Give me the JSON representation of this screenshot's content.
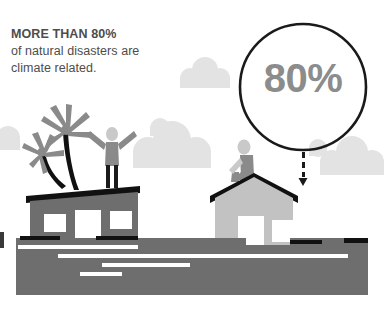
{
  "canvas": {
    "width": 384,
    "height": 318,
    "background": "#ffffff"
  },
  "headline": {
    "line1": "MORE THAN 80%",
    "line2": "of natural disasters are",
    "line3": "climate related.",
    "color": "#4d4d4d"
  },
  "stat_circle": {
    "value_label": "80%",
    "ring_color": "#1a1a1a",
    "value_color": "#8c8c8c",
    "center_x": 303,
    "center_y": 87,
    "radius": 63
  },
  "arrow": {
    "direction": "down",
    "color": "#1a1a1a",
    "dash_count": 3
  },
  "palette": {
    "house_left_wall": "#6e6e6e",
    "house_left_roof": "#111111",
    "house_right_wall": "#c2c2c2",
    "house_right_roof": "#111111",
    "window_fill": "#ffffff",
    "water": "#6e6e6e",
    "water_wave": "#ffffff",
    "cloud": "#e3e3e3",
    "palm_frond": "#8a8a8a",
    "palm_trunk": "#111111",
    "person_light": "#c9c9c9",
    "person_mid": "#8a8a8a",
    "person_dark": "#1a1a1a"
  },
  "elements": {
    "cloud_1_label": "cloud",
    "cloud_2_label": "cloud",
    "cloud_3_label": "cloud",
    "cloud_4_label": "cloud",
    "palm_tree_tall_label": "palm-tree",
    "palm_tree_short_label": "palm-tree",
    "person_standing_label": "person-arms-raised",
    "person_sitting_label": "person-seated",
    "house_left_label": "flooded-house-dark",
    "house_right_label": "flooded-house-light",
    "water_label": "flood-water"
  }
}
